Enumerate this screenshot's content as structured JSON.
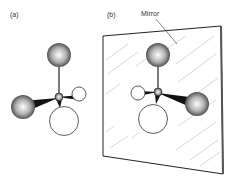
{
  "panels": [
    {
      "id": "a",
      "label": "(a)"
    },
    {
      "id": "b",
      "label": "(b)"
    }
  ],
  "annotations": {
    "mirror_label": "Mirror"
  },
  "colors": {
    "line": "#222222",
    "sphere_dark": "#3a3a3a",
    "sphere_light": "#ffffff",
    "hatch": "#bdbdbd"
  }
}
